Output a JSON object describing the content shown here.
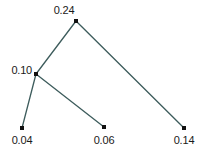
{
  "canvas": {
    "width": 205,
    "height": 154,
    "background": "#ffffff"
  },
  "style": {
    "edge_color": "#3d5c5c",
    "edge_width": 1.3,
    "node_color": "#111111",
    "node_size": 4,
    "label_color": "#1a1a1a",
    "label_font_size": 11
  },
  "chart_data": {
    "type": "diagram",
    "subtype": "tree-graph",
    "title": "",
    "xlabel": "",
    "ylabel": "",
    "grid": false,
    "legend": null,
    "nodes": [
      {
        "id": "n0.24",
        "label": "0.24",
        "value": 0.24,
        "x": 76,
        "y": 21,
        "label_position": "above-left",
        "label_x": 64,
        "label_y": 4,
        "degree": 2,
        "role": "root"
      },
      {
        "id": "n0.10",
        "label": "0.10",
        "value": 0.1,
        "x": 36,
        "y": 74,
        "label_position": "left",
        "label_x": 32,
        "label_y": 70,
        "degree": 3,
        "role": "internal"
      },
      {
        "id": "n0.04",
        "label": "0.04",
        "value": 0.04,
        "x": 22,
        "y": 128,
        "label_position": "below",
        "label_x": 22,
        "label_y": 134,
        "degree": 1,
        "role": "leaf"
      },
      {
        "id": "n0.06",
        "label": "0.06",
        "value": 0.06,
        "x": 104,
        "y": 127,
        "label_position": "below",
        "label_x": 104,
        "label_y": 134,
        "degree": 1,
        "role": "leaf"
      },
      {
        "id": "n0.14",
        "label": "0.14",
        "value": 0.14,
        "x": 184,
        "y": 128,
        "label_position": "below",
        "label_x": 184,
        "label_y": 134,
        "degree": 1,
        "role": "leaf"
      }
    ],
    "edges": [
      {
        "from": "n0.24",
        "to": "n0.10",
        "x1": 76,
        "y1": 21,
        "x2": 36,
        "y2": 74
      },
      {
        "from": "n0.24",
        "to": "n0.14",
        "x1": 76,
        "y1": 21,
        "x2": 184,
        "y2": 128
      },
      {
        "from": "n0.10",
        "to": "n0.04",
        "x1": 36,
        "y1": 74,
        "x2": 22,
        "y2": 128
      },
      {
        "from": "n0.10",
        "to": "n0.06",
        "x1": 36,
        "y1": 74,
        "x2": 104,
        "y2": 127
      }
    ],
    "values": [
      0.24,
      0.1,
      0.04,
      0.06,
      0.14
    ],
    "categories": [
      "0.24",
      "0.10",
      "0.04",
      "0.06",
      "0.14"
    ]
  }
}
